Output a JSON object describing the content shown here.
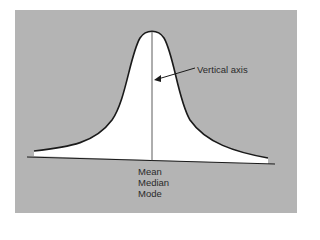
{
  "diagram": {
    "annotation": "Vertical axis",
    "center_labels": [
      "Mean",
      "Median",
      "Mode"
    ],
    "colors": {
      "background": "#b4b4b4",
      "curve_fill": "#ffffff",
      "line": "#1a1a1a"
    }
  }
}
